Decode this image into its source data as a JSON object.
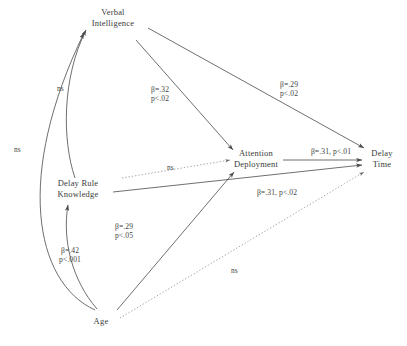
{
  "figure": {
    "type": "path-diagram",
    "background_color": "#ffffff",
    "stroke_color": "#4a4a4a",
    "text_color": "#3a3a3a"
  },
  "nodes": [
    {
      "id": "verbal_intelligence",
      "line1": "Verbal",
      "line2": "Intelligence",
      "x": 113,
      "y": 20
    },
    {
      "id": "delay_rule_knowledge",
      "line1": "Delay Rule",
      "line2": "Knowledge",
      "x": 78,
      "y": 188
    },
    {
      "id": "attention_deployment",
      "line1": "Attention",
      "line2": "Deployment",
      "x": 250,
      "y": 158
    },
    {
      "id": "delay_time",
      "line1": "Delay",
      "line2": "Time",
      "x": 379,
      "y": 158
    },
    {
      "id": "age",
      "line1": "Age",
      "line2": "",
      "x": 101,
      "y": 321
    }
  ],
  "paths": [
    {
      "id": "vi-to-attention",
      "from": "verbal_intelligence",
      "to": "attention_deployment",
      "beta": "β=.32",
      "p": "p<.02",
      "significant": true,
      "style": "solid",
      "label_x": 143,
      "label_y": 85
    },
    {
      "id": "vi-to-delaytime",
      "from": "verbal_intelligence",
      "to": "delay_time",
      "beta": "β=.29",
      "p": "p<.02",
      "significant": true,
      "style": "solid",
      "label_x": 270,
      "label_y": 82
    },
    {
      "id": "attention-to-delaytime",
      "from": "attention_deployment",
      "to": "delay_time",
      "beta": "β=.31, p<.01",
      "p": "",
      "significant": true,
      "style": "solid",
      "label_x": 296,
      "label_y": 147
    },
    {
      "id": "drk-to-delaytime",
      "from": "delay_rule_knowledge",
      "to": "delay_time",
      "beta": "β=.31, p<.02",
      "p": "",
      "significant": true,
      "style": "solid",
      "label_x": 238,
      "label_y": 188
    },
    {
      "id": "age-to-attention",
      "from": "age",
      "to": "attention_deployment",
      "beta": "β=.29",
      "p": "p<.05",
      "significant": true,
      "style": "solid",
      "label_x": 105,
      "label_y": 222
    },
    {
      "id": "age-to-drk",
      "from": "age",
      "to": "delay_rule_knowledge",
      "beta": "β=.42",
      "p": "p<.001",
      "significant": true,
      "style": "solid",
      "label_x": 55,
      "label_y": 246
    },
    {
      "id": "age-to-verbal",
      "from": "age",
      "to": "verbal_intelligence",
      "beta": "ns",
      "p": "",
      "significant": false,
      "style": "solid-curve",
      "label_x": 14,
      "label_y": 145
    },
    {
      "id": "drk-to-verbal",
      "from": "delay_rule_knowledge",
      "to": "verbal_intelligence",
      "beta": "ns",
      "p": "",
      "significant": false,
      "style": "solid-curve",
      "label_x": 57,
      "label_y": 84
    },
    {
      "id": "drk-to-attention",
      "from": "delay_rule_knowledge",
      "to": "attention_deployment",
      "beta": "ns",
      "p": "",
      "significant": false,
      "style": "dotted",
      "label_x": 167,
      "label_y": 163
    },
    {
      "id": "age-to-delaytime",
      "from": "age",
      "to": "delay_time",
      "beta": "ns",
      "p": "",
      "significant": false,
      "style": "dotted",
      "label_x": 231,
      "label_y": 266
    }
  ]
}
